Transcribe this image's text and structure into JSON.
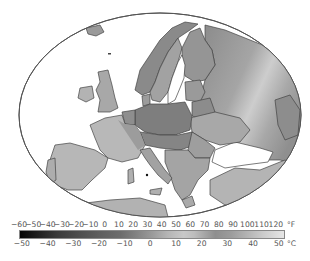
{
  "map": {
    "title": "",
    "subject": "Europe temperature map (grayscale shading)",
    "colors": {
      "sea": "#ffffff",
      "outline": "#555555",
      "border": "#3a3a3a",
      "shade_dark": "#7d7d7d",
      "shade_mid": "#9b9b9b",
      "shade_light": "#b9b9b9",
      "shade_lightest": "#d2d2d2"
    }
  },
  "legend": {
    "fahrenheit": {
      "unit": "°F",
      "ticks": [
        "−60",
        "−50",
        "−40",
        "−30",
        "−20",
        "−10",
        "0",
        "10",
        "20",
        "30",
        "40",
        "50",
        "60",
        "70",
        "80",
        "90",
        "100",
        "110",
        "120"
      ]
    },
    "celsius": {
      "unit": "°C",
      "ticks": [
        "−50",
        "−40",
        "−30",
        "−20",
        "−10",
        "0",
        "10",
        "20",
        "30",
        "40",
        "50"
      ]
    },
    "range_f": [
      -60,
      125
    ],
    "range_c": [
      -51.1,
      51.7
    ]
  }
}
